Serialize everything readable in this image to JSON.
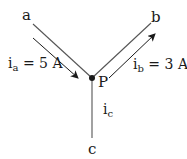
{
  "diagram": {
    "colors": {
      "wire": "#555555",
      "arrow": "#1a1a1a",
      "text": "#1a1a1a",
      "background": "#ffffff"
    },
    "junction": {
      "label": "P"
    },
    "nodes": {
      "a": {
        "label": "a"
      },
      "b": {
        "label": "b"
      },
      "c": {
        "label": "c"
      }
    },
    "currents": {
      "ia": {
        "symbol": "i",
        "subscript": "a",
        "eq": " = 5 A",
        "value": 5,
        "unit": "A",
        "direction": "into P"
      },
      "ib": {
        "symbol": "i",
        "subscript": "b",
        "eq": " = 3 A",
        "value": 3,
        "unit": "A",
        "direction": "out of P"
      },
      "ic": {
        "symbol": "i",
        "subscript": "c"
      }
    }
  }
}
